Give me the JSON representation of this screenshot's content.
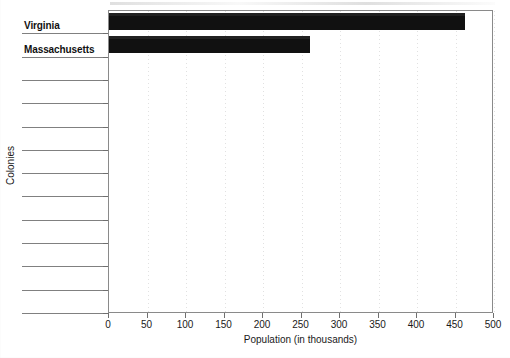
{
  "chart_data": {
    "type": "bar",
    "orientation": "horizontal",
    "title": "",
    "xlabel": "Population (in thousands)",
    "ylabel": "Colonies",
    "xlim": [
      0,
      500
    ],
    "xticks": [
      0,
      50,
      100,
      150,
      200,
      250,
      300,
      350,
      400,
      450,
      500
    ],
    "xtick_labels": [
      "0",
      "50",
      "100",
      "150",
      "200",
      "250",
      "300",
      "350",
      "400",
      "450",
      "500"
    ],
    "grid": "faint vertical dotted gridlines at each x tick",
    "legend": "none",
    "bar_color": "#111111",
    "categories": [
      "Virginia",
      "Massachusetts",
      "",
      "",
      "",
      "",
      "",
      "",
      "",
      "",
      "",
      "",
      ""
    ],
    "values": [
      462,
      261,
      0,
      0,
      0,
      0,
      0,
      0,
      0,
      0,
      0,
      0,
      0
    ],
    "labeled_points": [
      {
        "category": "Virginia",
        "value": 462
      },
      {
        "category": "Massachusetts",
        "value": 261
      }
    ],
    "note": "Scanned worksheet bar chart; 13 category rows total, only the top two are filled in."
  },
  "axes": {
    "x_title": "Population (in thousands)",
    "y_title": "Colonies",
    "ticks": [
      "0",
      "50",
      "100",
      "150",
      "200",
      "250",
      "300",
      "350",
      "400",
      "450",
      "500"
    ]
  },
  "rows": [
    {
      "label": "Virginia"
    },
    {
      "label": "Massachusetts"
    },
    {
      "label": ""
    },
    {
      "label": ""
    },
    {
      "label": ""
    },
    {
      "label": ""
    },
    {
      "label": ""
    },
    {
      "label": ""
    },
    {
      "label": ""
    },
    {
      "label": ""
    },
    {
      "label": ""
    },
    {
      "label": ""
    },
    {
      "label": ""
    }
  ]
}
